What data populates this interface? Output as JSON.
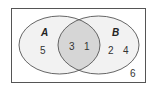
{
  "diagram": {
    "type": "venn",
    "sets": [
      {
        "name": "A",
        "label": "A"
      },
      {
        "name": "B",
        "label": "B"
      }
    ],
    "regions": {
      "only_A": [
        "5"
      ],
      "intersection": [
        "3",
        "1"
      ],
      "only_B": [
        "2",
        "4"
      ],
      "outside": [
        "6"
      ]
    },
    "colors": {
      "border": "#555555",
      "circle_fill": "#f2f2f2",
      "intersection_fill": "#d6d6d6",
      "background": "#ffffff"
    }
  },
  "labels": {
    "set_a": "A",
    "set_b": "B",
    "a_only_1": "5",
    "ab_1": "3",
    "ab_2": "1",
    "b_only_1": "2",
    "b_only_2": "4",
    "outside_1": "6"
  }
}
